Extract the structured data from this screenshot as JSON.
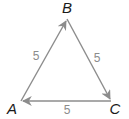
{
  "diagram": {
    "type": "vector-triangle",
    "colors": {
      "edge": "#8c8c8c",
      "vertex_label": "#1a1a1a",
      "side_label": "#8c8c8c"
    },
    "vertices": [
      {
        "id": "A",
        "label": "A",
        "x": 21,
        "y": 101,
        "lx": 12,
        "ly": 114
      },
      {
        "id": "B",
        "label": "B",
        "x": 67,
        "y": 19,
        "lx": 67,
        "ly": 13
      },
      {
        "id": "C",
        "label": "C",
        "x": 111,
        "y": 101,
        "lx": 115,
        "ly": 114
      }
    ],
    "edges": [
      {
        "from": "A",
        "to": "B",
        "label": "5",
        "lx": 36,
        "ly": 60
      },
      {
        "from": "B",
        "to": "C",
        "label": "5",
        "lx": 97,
        "ly": 62
      },
      {
        "from": "C",
        "to": "A",
        "label": "5",
        "lx": 67,
        "ly": 114
      }
    ]
  }
}
